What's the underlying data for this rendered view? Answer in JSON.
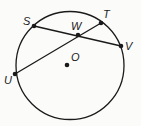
{
  "diagram": {
    "type": "circle-geometry",
    "colors": {
      "stroke": "#1a1a1a",
      "background": "#fbfbfa"
    },
    "circle": {
      "center": "O",
      "cx": 70,
      "cy": 65.5,
      "r": 54
    },
    "points": {
      "S": {
        "label": "S",
        "x": 34,
        "y": 26
      },
      "T": {
        "label": "T",
        "x": 101,
        "y": 23
      },
      "V": {
        "label": "V",
        "x": 121,
        "y": 46
      },
      "U": {
        "label": "U",
        "x": 15,
        "y": 74
      },
      "W": {
        "label": "W",
        "x": 78,
        "y": 35
      },
      "O": {
        "label": "O",
        "x": 67,
        "y": 65
      }
    },
    "chords": [
      {
        "name": "SV",
        "from": "S",
        "to": "V"
      },
      {
        "name": "UT",
        "from": "U",
        "to": "T"
      }
    ]
  }
}
